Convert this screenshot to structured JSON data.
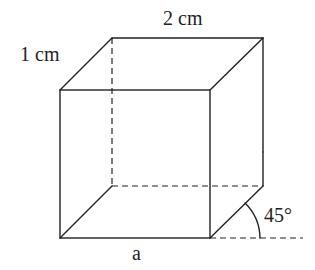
{
  "diagram": {
    "type": "cuboid-oblique-projection",
    "labels": {
      "top_edge": "2 cm",
      "depth_edge": "1 cm",
      "bottom_edge": "a",
      "angle": "45°"
    },
    "colors": {
      "stroke": "#222222",
      "background": "#ffffff"
    }
  }
}
